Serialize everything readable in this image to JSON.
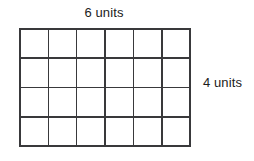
{
  "figure": {
    "kind": "rectangle-area-grid",
    "background_color": "#ffffff",
    "line_color": "#39393b",
    "text_color": "#1b1b1b"
  },
  "labels": {
    "top": "6 units",
    "right": "4 units"
  },
  "grid": {
    "columns": 6,
    "rows": 4,
    "total_cells": 24,
    "x_left_px": 19,
    "y_top_px": 28,
    "width_px": 172,
    "height_px": 119,
    "cell_width_px": 28.7,
    "cell_height_px": 29.8
  }
}
